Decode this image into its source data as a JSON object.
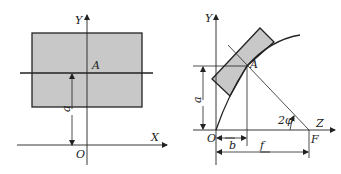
{
  "figure_left": {
    "labels": {
      "y_axis": "Y",
      "x_axis": "X",
      "origin": "O",
      "point": "A",
      "height": "a"
    },
    "colors": {
      "fill": "#c8c8c8",
      "stroke": "#222222"
    }
  },
  "figure_right": {
    "labels": {
      "y_axis": "Y",
      "z_axis": "Z",
      "origin": "O",
      "point": "A",
      "focus": "F",
      "height": "a",
      "offset": "b",
      "focal_length": "f",
      "angle": "2φ"
    },
    "colors": {
      "fill": "#c8c8c8",
      "stroke": "#222222"
    }
  }
}
